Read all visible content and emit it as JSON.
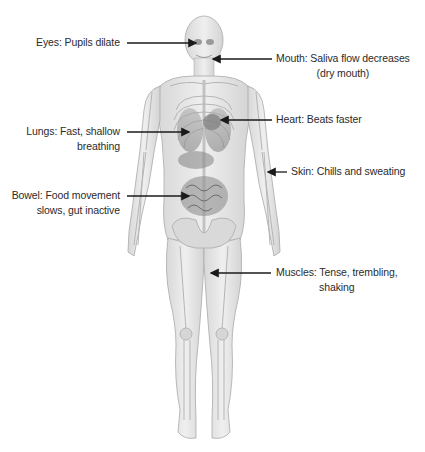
{
  "diagram": {
    "callouts": [
      {
        "id": "eyes",
        "line1": "Eyes: Pupils dilate",
        "line2": ""
      },
      {
        "id": "mouth",
        "line1": "Mouth: Saliva flow decreases",
        "line2": "(dry mouth)"
      },
      {
        "id": "heart",
        "line1": "Heart: Beats faster",
        "line2": ""
      },
      {
        "id": "lungs",
        "line1": "Lungs: Fast, shallow",
        "line2": "breathing"
      },
      {
        "id": "skin",
        "line1": "Skin: Chills and sweating",
        "line2": ""
      },
      {
        "id": "bowel",
        "line1": "Bowel: Food movement",
        "line2": "slows, gut inactive"
      },
      {
        "id": "muscles",
        "line1": "Muscles: Tense, trembling,",
        "line2": "shaking"
      }
    ],
    "colors": {
      "background": "#ffffff",
      "text": "#2b2b2b",
      "arrow": "#1a1a1a",
      "body_fill": "#e4e4e4",
      "bone": "#c9c9c9",
      "organ": "#8f8f8f"
    }
  }
}
